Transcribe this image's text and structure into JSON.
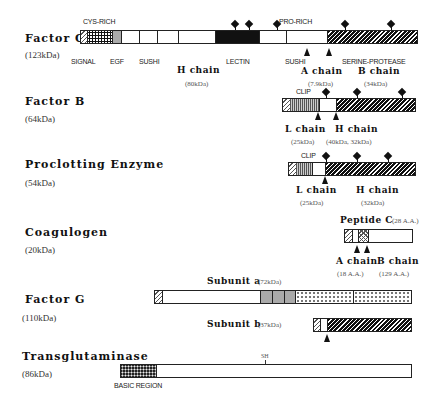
{
  "proteins": {
    "factor_c": {
      "name": "Factor C",
      "mw": "(123kDa)",
      "domain_labels": {
        "cys_rich": "CYS-RICH",
        "signal": "SIGNAL",
        "egf": "EGF",
        "sushi1": "SUSHI",
        "lectin": "LECTIN",
        "pro_rich": "PRO-RICH",
        "sushi2": "SUSHI",
        "serine_protease": "SERINE-PROTEASE"
      },
      "chains": {
        "h": {
          "label": "H  chain",
          "mw": "(80kDa)"
        },
        "a": {
          "label": "A  chain",
          "mw": "(7.9kDa)"
        },
        "b": {
          "label": "B  chain",
          "mw": "(34kDa)"
        }
      }
    },
    "factor_b": {
      "name": "Factor  B",
      "mw": "(64kDa)",
      "domain_labels": {
        "clip": "CLIP"
      },
      "chains": {
        "l": {
          "label": "L  chain",
          "mw": "(25kDa)"
        },
        "h": {
          "label": "H  chain",
          "mw": "(40kDa, 32kDa)"
        }
      }
    },
    "proclotting_enzyme": {
      "name": "Proclotting  Enzyme",
      "mw": "(54kDa)",
      "domain_labels": {
        "clip": "CLIP"
      },
      "chains": {
        "l": {
          "label": "L  chain",
          "mw": "(25kDa)"
        },
        "h": {
          "label": "H  chain",
          "mw": "(32kDa)"
        }
      }
    },
    "coagulogen": {
      "name": "Coagulogen",
      "mw": "(20kDa)",
      "peptide_c": {
        "label": "Peptide  C",
        "mw": "(28 A.A.)"
      },
      "chains": {
        "a": {
          "label": "A  chain",
          "mw": "(18 A.A.)"
        },
        "b": {
          "label": "B  chain",
          "mw": "(129 A.A.)"
        }
      }
    },
    "factor_g": {
      "name": "Factor  G",
      "mw": "(110kDa)",
      "subunit_a": {
        "label": "Subunit  a",
        "mw": "(72kDa)"
      },
      "subunit_b": {
        "label": "Subunit  b",
        "mw": "(37kDa)"
      }
    },
    "transglutaminase": {
      "name": "Transglutaminase",
      "mw": "(86kDa)",
      "domain_labels": {
        "basic_region": "BASIC REGION",
        "sh": "SH"
      }
    }
  }
}
